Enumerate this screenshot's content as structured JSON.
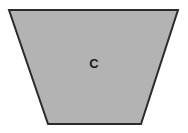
{
  "figure": {
    "type": "trapezoid",
    "label": "C",
    "label_position": {
      "x": 92,
      "y": 57
    },
    "fill_color": "#b3b3b3",
    "stroke_color": "#2b2b2b",
    "stroke_width": 2,
    "background_color": "#ffffff",
    "canvas": {
      "width": 188,
      "height": 133
    },
    "vertices": [
      {
        "name": "top-left",
        "x": 9,
        "y": 10
      },
      {
        "name": "top-right",
        "x": 178,
        "y": 10
      },
      {
        "name": "bottom-right",
        "x": 141,
        "y": 124
      },
      {
        "name": "bottom-left",
        "x": 48,
        "y": 124
      }
    ],
    "points_attr": "9,10 178,10 141,124 48,124"
  }
}
